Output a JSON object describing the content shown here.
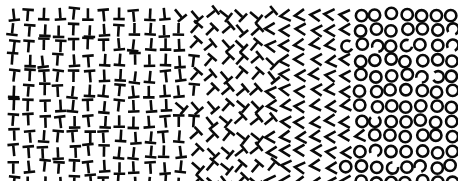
{
  "figure": {
    "width": 458,
    "height": 181,
    "background_color": "#ffffff",
    "stroke_color": "#0a0a0a",
    "margin_left": 8,
    "margin_top": 9,
    "margin_right": 2,
    "margin_bottom": 2
  },
  "grid": {
    "pitch_x": 15.1,
    "pitch_y": 15.2,
    "columns": 31,
    "rows": 12,
    "jitter_x": 3.2,
    "jitter_y": 3.0,
    "glyph_size": 11.5,
    "stroke_width": 2.6,
    "jitter_seed": 20240517
  },
  "bands": [
    {
      "id": "band-upright-t",
      "label": "Upright T",
      "glyph": "T",
      "symbol": "T",
      "rotation_deg": 0,
      "x_start": 0,
      "x_end": 0.21,
      "description": "T glyphs with crossbar on top, stem pointing down"
    },
    {
      "id": "band-inverted-t",
      "label": "Inverted T",
      "glyph": "T",
      "symbol": "⊥",
      "rotation_deg": 180,
      "x_start": 0.21,
      "x_end": 0.4,
      "description": "Inverted T glyphs, crossbar on bottom"
    },
    {
      "id": "band-diagonal-t",
      "label": "Diagonal T",
      "glyph": "T",
      "symbol": "⊢",
      "rotation_deg": 45,
      "x_start": 0.4,
      "x_end": 0.59,
      "description": "T glyphs rotated approximately 45 degrees"
    },
    {
      "id": "band-chevron",
      "label": "Chevron",
      "glyph": "chevron",
      "symbol": "<",
      "rotation_deg": 0,
      "x_start": 0.59,
      "x_end": 0.77,
      "description": "Angular V chevrons opening to the right"
    },
    {
      "id": "band-circle",
      "label": "Circle",
      "glyph": "circle",
      "symbol": "O",
      "rotation_deg": 0,
      "x_start": 0.77,
      "x_end": 1.0,
      "description": "Open ring outlines, some clipped into C shapes"
    }
  ],
  "transitions": [
    {
      "name": "t-to-inverted-t",
      "x_px": 96,
      "softness": 0.09
    },
    {
      "name": "inverted-t-to-diagonal",
      "x_px": 185,
      "softness": 0.07
    },
    {
      "name": "diagonal-to-chevron",
      "x_px": 270,
      "softness": 0.07
    },
    {
      "name": "chevron-to-circle",
      "x_px": 350,
      "softness": 0.06
    }
  ]
}
